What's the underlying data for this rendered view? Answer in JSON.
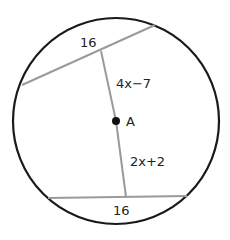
{
  "diagram": {
    "type": "circle-chords",
    "center_label": "A",
    "top_chord": {
      "length_label": "16",
      "distance_label": "4x−7"
    },
    "bottom_chord": {
      "length_label": "16",
      "distance_label": "2x+2"
    },
    "colors": {
      "circle": "#1a1a1a",
      "chord": "#9a9a9a",
      "point": "#111111"
    }
  }
}
